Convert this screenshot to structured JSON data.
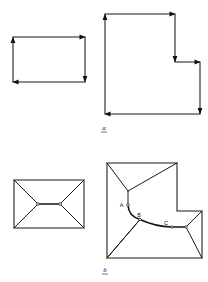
{
  "figure": {
    "title": "",
    "panels": [
      {
        "id": "a",
        "caption": "a",
        "description": "Two input polygons with directed boundary edges",
        "shapes": [
          {
            "name": "rectangle-outline",
            "type": "rectangle",
            "vertices": "13,37 85,37 85,82 13,82",
            "edge_directions": [
              "right",
              "down",
              "left",
              "up"
            ],
            "arrow_count": 4
          },
          {
            "name": "l-shape-outline",
            "type": "l-polygon",
            "vertices": "105,14 175,14 175,62 200,62 200,114 105,114",
            "edge_directions": [
              "right",
              "down",
              "right",
              "down",
              "left",
              "up"
            ],
            "arrow_count": 6
          }
        ]
      },
      {
        "id": "b",
        "caption": "b",
        "description": "Medial axis / straight skeleton of the same polygons",
        "shapes": [
          {
            "name": "rectangle-skeleton",
            "type": "rectangle",
            "vertices": "14,180 84,180 84,228 14,228",
            "skeleton_nodes": [
              "38,204",
              "60,204"
            ],
            "skeleton_segments": 5
          },
          {
            "name": "l-shape-skeleton",
            "type": "l-polygon",
            "vertices": "107,163 177,163 177,211 202,211 202,258 107,258",
            "skeleton_nodes": [
              "A",
              "B",
              "C"
            ],
            "arc_type": "parabolic",
            "skeleton_segments": 9
          }
        ],
        "point_labels": [
          {
            "name": "label-A",
            "text": "A",
            "x": 125,
            "y": 205
          },
          {
            "name": "label-B",
            "text": "B",
            "x": 139,
            "y": 220
          },
          {
            "name": "label-C",
            "text": "C",
            "x": 163,
            "y": 228
          }
        ]
      }
    ],
    "colors": {
      "stroke": "#1a1a1a",
      "background": "#ffffff",
      "label": "#111111"
    }
  }
}
